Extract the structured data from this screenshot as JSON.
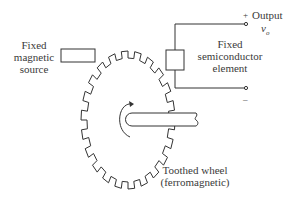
{
  "labels": {
    "magnetic_source": [
      "Fixed",
      "magnetic",
      "source"
    ],
    "semiconductor": [
      "Fixed",
      "semiconductor",
      "element"
    ],
    "output_plus": "+",
    "output_label": "Output",
    "output_symbol": "v",
    "output_subscript": "o",
    "output_minus": "–",
    "wheel": [
      "Toothed wheel",
      "(ferromagnetic)"
    ]
  },
  "colors": {
    "line": "#333333",
    "text": "#3a3a3a",
    "background": "#ffffff"
  },
  "geometry": {
    "wheel_teeth": 22,
    "wheel_center": [
      128,
      120
    ],
    "wheel_rx": 47,
    "wheel_ry": 69
  }
}
